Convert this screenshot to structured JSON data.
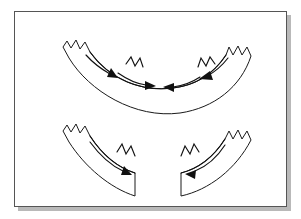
{
  "figure": {
    "background_color": "#ffffff",
    "frame_color": "#555555",
    "ink_color": "#1a1a1a",
    "shadow_color": "#b9b9b9",
    "panel_count": 2,
    "panels": [
      {
        "id": "panel-top",
        "name": "continuous-arc",
        "description": "Single unbroken curved band, concave upward, with jagged torn upper edge and four convergent arrows along its length",
        "segments": 1,
        "gap_present": false,
        "arrow_count": 4,
        "arrow_directions": [
          "right",
          "right",
          "left",
          "left"
        ],
        "convergence": "inward toward center"
      },
      {
        "id": "panel-bottom",
        "name": "split-arc",
        "description": "Same curved band separated into two halves by a vertical gap at the center, each half carrying one inward arrow",
        "segments": 2,
        "gap_present": true,
        "arrow_count": 2,
        "arrow_directions": [
          "right",
          "left"
        ],
        "convergence": "inward toward gap"
      }
    ]
  },
  "geometry": {
    "top_band": {
      "outer_path": "M 49 36 L 53 31 L 57 37 L 62 30 L 66 38 L 71 32 L 76 41 C 96 69 128 80 159 76 C 183 73 199 62 211 44 L 215 37 L 219 44 L 224 36 L 228 44 L 233 37 L 237 45 C 226 75 200 96 166 101 C 121 107 76 80 56 47 Z",
      "inner_path": "M 76 41 C 96 69 128 80 159 76 C 183 73 199 62 211 44",
      "notch_path": "M 116 55 L 120 48 L 124 56 L 129 49 L 131 57 C 148 66 167 65 180 57 L 182 49 L 187 56 L 191 48 L 195 55"
    },
    "bottom_left_band": {
      "path": "M 49 120 L 53 115 L 57 121 L 62 114 L 66 122 L 71 116 L 76 125 C 90 145 106 156 122 160 L 122 183 C 97 176 71 155 56 131 Z"
    },
    "bottom_right_band": {
      "path": "M 237 129 L 233 121 L 228 128 L 224 120 L 219 128 L 215 121 L 211 128 C 199 146 183 157 166 161 L 166 184 C 195 179 222 158 237 129 Z"
    },
    "gap": {
      "left_x": 122,
      "right_x": 166,
      "top_y": 158,
      "bottom_y": 185
    }
  },
  "arrows": {
    "top_panel": [
      {
        "id": "arrow-outer-left",
        "direction": "right",
        "path": "M 72 44 C 80 53 89 59 97 63",
        "tip": [
          99,
          64
        ],
        "angle": 30
      },
      {
        "id": "arrow-inner-left",
        "direction": "right",
        "path": "M 104 61 C 114 68 124 72 133 74",
        "tip": [
          136,
          74
        ],
        "angle": 12
      },
      {
        "id": "arrow-inner-right",
        "direction": "left",
        "path": "M 186 66 C 176 72 166 75 158 75",
        "tip": [
          155,
          75
        ],
        "angle": 192
      },
      {
        "id": "arrow-outer-right",
        "direction": "left",
        "path": "M 214 47 C 207 56 199 61 192 64",
        "tip": [
          189,
          65
        ],
        "angle": 156
      }
    ],
    "bottom_panel": [
      {
        "id": "arrow-bottom-left",
        "direction": "right",
        "path": "M 76 131 C 87 146 99 155 110 160",
        "tip": [
          113,
          161
        ],
        "angle": 26
      },
      {
        "id": "arrow-bottom-right",
        "direction": "left",
        "path": "M 211 134 C 201 148 190 156 180 160",
        "tip": [
          177,
          161
        ],
        "angle": 160
      }
    ]
  }
}
